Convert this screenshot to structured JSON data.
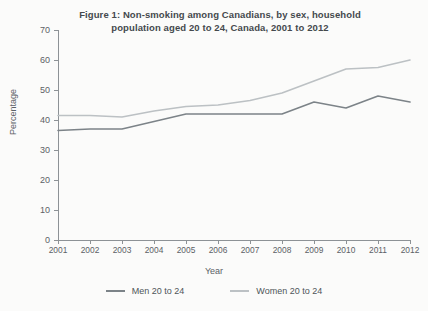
{
  "chart_data": {
    "type": "line",
    "title": "Figure 1: Non-smoking among Canadians, by sex, household population aged 20 to 24, Canada, 2001 to 2012",
    "title_line1": "Figure 1: Non-smoking among Canadians, by sex, household",
    "title_line2": "population aged 20 to 24, Canada, 2001 to 2012",
    "xlabel": "Year",
    "ylabel": "Percentage",
    "categories": [
      "2001",
      "2002",
      "2003",
      "2004",
      "2005",
      "2006",
      "2007",
      "2008",
      "2009",
      "2010",
      "2011",
      "2012"
    ],
    "x": [
      2001,
      2002,
      2003,
      2004,
      2005,
      2006,
      2007,
      2008,
      2009,
      2010,
      2011,
      2012
    ],
    "ylim": [
      0,
      70
    ],
    "xlim": [
      2001,
      2012
    ],
    "yticks": [
      0,
      10,
      20,
      30,
      40,
      50,
      60,
      70
    ],
    "grid": false,
    "legend_position": "bottom",
    "series": [
      {
        "name": "Men 20 to 24",
        "color": "#7c8388",
        "values": [
          36.5,
          37.0,
          37.0,
          39.5,
          42.0,
          42.0,
          42.0,
          42.0,
          46.0,
          44.0,
          48.0,
          46.0
        ]
      },
      {
        "name": "Women 20 to 24",
        "color": "#bcc1c4",
        "values": [
          41.5,
          41.5,
          41.0,
          43.0,
          44.5,
          45.0,
          46.5,
          49.0,
          53.0,
          57.0,
          57.5,
          60.0
        ]
      }
    ]
  },
  "legend": {
    "items": [
      {
        "label": "Men 20 to 24"
      },
      {
        "label": "Women 20 to 24"
      }
    ]
  }
}
